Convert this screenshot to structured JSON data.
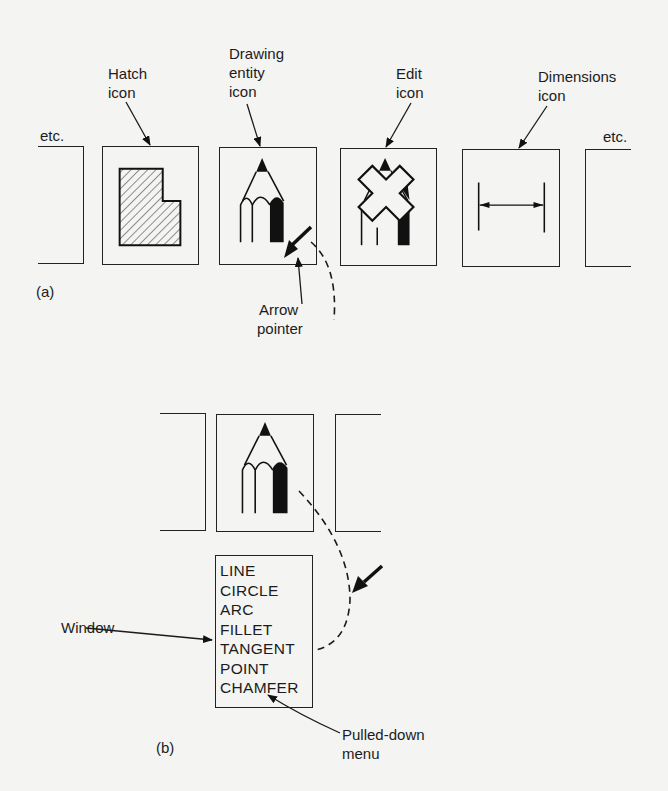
{
  "figure": {
    "part_a": {
      "caption": "(a)",
      "left_etc": "etc.",
      "right_etc": "etc.",
      "icons": [
        {
          "id": "hatch",
          "label_line1": "Hatch",
          "label_line2": "icon"
        },
        {
          "id": "drawing-entity",
          "label_line1": "Drawing",
          "label_line2": "entity",
          "label_line3": "icon"
        },
        {
          "id": "edit",
          "label_line1": "Edit",
          "label_line2": "icon"
        },
        {
          "id": "dimensions",
          "label_line1": "Dimensions",
          "label_line2": "icon"
        }
      ],
      "pointer_label_line1": "Arrow",
      "pointer_label_line2": "pointer"
    },
    "part_b": {
      "caption": "(b)",
      "window_label": "Window",
      "menu_label_line1": "Pulled-down",
      "menu_label_line2": "menu",
      "menu_items": [
        "LINE",
        "CIRCLE",
        "ARC",
        "FILLET",
        "TANGENT",
        "POINT",
        "CHAMFER"
      ]
    }
  }
}
